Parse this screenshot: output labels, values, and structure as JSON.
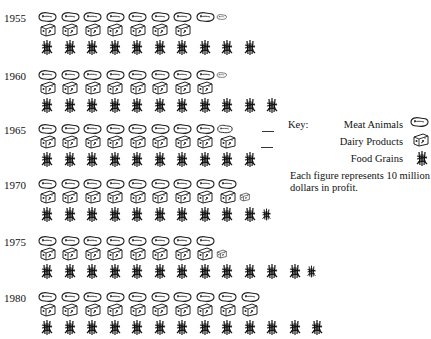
{
  "chart_data": {
    "type": "pictograph",
    "title": "",
    "xlabel": "",
    "ylabel": "",
    "unit_note": "Each figure represents 10 million dollars in profit.",
    "unit_value": 10,
    "unit": "million dollars",
    "categories": [
      "1955",
      "1960",
      "1965",
      "1970",
      "1975",
      "1980"
    ],
    "series": [
      {
        "name": "Meat Animals",
        "icon": "meat-icon",
        "icon_counts": [
          8.5,
          8.5,
          8.75,
          9,
          8,
          10
        ],
        "values": [
          85,
          85,
          87.5,
          90,
          80,
          100
        ]
      },
      {
        "name": "Dairy Products",
        "icon": "cheese-icon",
        "icon_counts": [
          7,
          8,
          9,
          9.5,
          8.5,
          10
        ],
        "values": [
          70,
          80,
          90,
          95,
          85,
          100
        ]
      },
      {
        "name": "Food Grains",
        "icon": "wheat-icon",
        "icon_counts": [
          10,
          11,
          10,
          10.5,
          12.5,
          13
        ],
        "values": [
          100,
          110,
          100,
          105,
          125,
          130
        ]
      }
    ],
    "legend_position": "right"
  },
  "key": {
    "title": "Key:",
    "items": [
      {
        "label": "Meat Animals",
        "icon": "meat-icon"
      },
      {
        "label": "Dairy Products",
        "icon": "cheese-icon"
      },
      {
        "label": "Food Grains",
        "icon": "wheat-icon"
      }
    ],
    "note": "Each figure represents 10 million dollars in profit."
  },
  "years": [
    {
      "label": "1955",
      "top": 10
    },
    {
      "label": "1960",
      "top": 68
    },
    {
      "label": "1965",
      "top": 122
    },
    {
      "label": "1970",
      "top": 177
    },
    {
      "label": "1975",
      "top": 234
    },
    {
      "label": "1980",
      "top": 290
    }
  ]
}
